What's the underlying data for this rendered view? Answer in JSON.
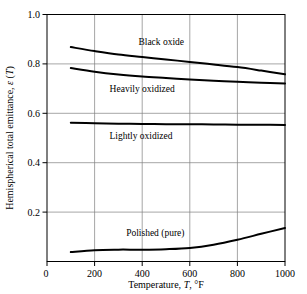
{
  "chart_data": {
    "type": "line",
    "title": "",
    "xlabel": "Temperature, T, °F",
    "ylabel": "Hemispherical total emittance, ε (T)",
    "xlim": [
      0,
      1000
    ],
    "ylim": [
      0,
      1.0
    ],
    "xticks": [
      0,
      200,
      400,
      600,
      800,
      1000
    ],
    "xtick_labels": [
      "0",
      "200",
      "400",
      "600",
      "800",
      "1000"
    ],
    "yticks": [
      0.2,
      0.4,
      0.6,
      0.8,
      1.0
    ],
    "ytick_labels": [
      "0.2",
      "0.4",
      "0.6",
      "0.8",
      "1.0"
    ],
    "grid": "both",
    "legend": "inline-annotations",
    "line_color": "#000000",
    "grid_color": "#808080",
    "axis_color": "#000000",
    "series": [
      {
        "name": "Black oxide",
        "label": "Black oxide",
        "label_x": 480,
        "label_y": 0.875,
        "x": [
          100,
          200,
          300,
          400,
          500,
          600,
          700,
          800,
          900,
          1000
        ],
        "values": [
          0.868,
          0.852,
          0.838,
          0.828,
          0.818,
          0.808,
          0.798,
          0.787,
          0.773,
          0.758
        ]
      },
      {
        "name": "Heavily oxidized",
        "label": "Heavily oxidized",
        "label_x": 400,
        "label_y": 0.687,
        "x": [
          100,
          200,
          300,
          400,
          500,
          600,
          700,
          800,
          900,
          1000
        ],
        "values": [
          0.783,
          0.768,
          0.757,
          0.749,
          0.743,
          0.737,
          0.732,
          0.728,
          0.724,
          0.721
        ]
      },
      {
        "name": "Lightly oxidized",
        "label": "Lightly oxidized",
        "label_x": 395,
        "label_y": 0.497,
        "x": [
          100,
          200,
          300,
          400,
          500,
          600,
          700,
          800,
          900,
          1000
        ],
        "values": [
          0.562,
          0.56,
          0.558,
          0.557,
          0.556,
          0.556,
          0.555,
          0.554,
          0.554,
          0.553
        ]
      },
      {
        "name": "Polished (pure)",
        "label": "Polished (pure)",
        "label_x": 455,
        "label_y": 0.105,
        "x": [
          100,
          200,
          300,
          400,
          500,
          600,
          700,
          800,
          900,
          1000
        ],
        "values": [
          0.038,
          0.046,
          0.048,
          0.048,
          0.05,
          0.055,
          0.068,
          0.088,
          0.112,
          0.136
        ]
      }
    ]
  }
}
